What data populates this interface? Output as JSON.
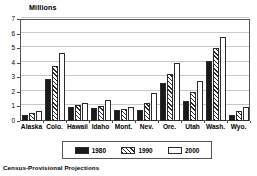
{
  "chart_data": {
    "type": "bar",
    "title": "Millions",
    "xlabel": "",
    "ylabel": "Millions",
    "ylim": [
      0,
      7
    ],
    "yticks": [
      0,
      1,
      2,
      3,
      4,
      5,
      6,
      7
    ],
    "ytick_labels": [
      "0",
      "1",
      "2",
      "3",
      "4",
      "5",
      "6",
      "7"
    ],
    "grid": true,
    "legend_position": "bottom-center",
    "categories": [
      "Alaska",
      "Colo.",
      "Hawaii",
      "Idaho",
      "Mont.",
      "Nev.",
      "Ore.",
      "Utah",
      "Wash.",
      "Wyo."
    ],
    "series": [
      {
        "name": "1980",
        "color": "#1a1a1a",
        "pattern": "solid",
        "values": [
          0.4,
          2.9,
          0.95,
          0.9,
          0.75,
          0.75,
          2.6,
          1.35,
          4.1,
          0.4
        ]
      },
      {
        "name": "1990",
        "color": "#ffffff",
        "pattern": "diagonal-hatch",
        "values": [
          0.55,
          3.8,
          1.1,
          1.0,
          0.8,
          1.25,
          3.25,
          2.0,
          5.0,
          0.7
        ]
      },
      {
        "name": "2000",
        "color": "#ffffff",
        "pattern": "empty",
        "values": [
          0.7,
          4.65,
          1.25,
          1.45,
          0.95,
          1.9,
          4.0,
          2.75,
          5.8,
          0.95
        ]
      }
    ],
    "annotations": [
      "Census-Provisional Projections"
    ]
  },
  "footnote": "Census-Provisional Projections"
}
